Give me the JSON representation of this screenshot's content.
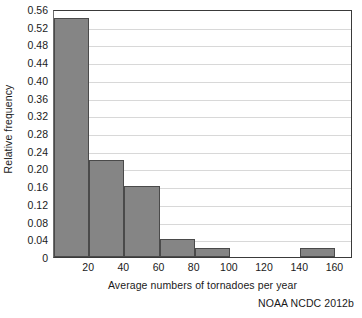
{
  "chart_data": {
    "type": "bar",
    "title": "",
    "subtitle": "",
    "xlabel": "Average numbers of tornadoes per year",
    "ylabel": "Relative frequency",
    "xlim": [
      0,
      170
    ],
    "ylim": [
      0,
      0.56
    ],
    "grid": "horizontal",
    "legend": "none",
    "xticks": [
      20,
      40,
      60,
      80,
      100,
      120,
      140,
      160
    ],
    "xtick_labels": [
      "20",
      "40",
      "60",
      "80",
      "100",
      "120",
      "140",
      "160"
    ],
    "yticks": [
      0,
      0.04,
      0.08,
      0.12,
      0.16,
      0.2,
      0.24,
      0.28,
      0.32,
      0.36,
      0.4,
      0.44,
      0.48,
      0.52,
      0.56
    ],
    "ytick_labels": [
      "0",
      "0.04",
      "0.08",
      "0.12",
      "0.16",
      "0.20",
      "0.24",
      "0.28",
      "0.32",
      "0.36",
      "0.40",
      "0.44",
      "0.48",
      "0.52",
      "0.56"
    ],
    "bin_width": 20,
    "bins": [
      {
        "label": "0-20",
        "x0": 0,
        "x1": 20,
        "value": 0.54
      },
      {
        "label": "20-40",
        "x0": 20,
        "x1": 40,
        "value": 0.22
      },
      {
        "label": "40-60",
        "x0": 40,
        "x1": 60,
        "value": 0.16
      },
      {
        "label": "60-80",
        "x0": 60,
        "x1": 80,
        "value": 0.04
      },
      {
        "label": "80-100",
        "x0": 80,
        "x1": 100,
        "value": 0.02
      },
      {
        "label": "100-120",
        "x0": 100,
        "x1": 120,
        "value": 0
      },
      {
        "label": "120-140",
        "x0": 120,
        "x1": 140,
        "value": 0
      },
      {
        "label": "140-160",
        "x0": 140,
        "x1": 160,
        "value": 0.02
      }
    ],
    "categories": [
      "0-20",
      "20-40",
      "40-60",
      "60-80",
      "80-100",
      "100-120",
      "120-140",
      "140-160"
    ],
    "values": [
      0.54,
      0.22,
      0.16,
      0.04,
      0.02,
      0,
      0,
      0.02
    ],
    "colors": {
      "bar_fill": "#858585",
      "bar_edge": "#4a4a4a",
      "gridline": "#d8d8d8",
      "axis": "#3a3a3a",
      "text": "#1a1a1a",
      "background": "#ffffff"
    }
  },
  "credit": "NOAA NCDC 2012b"
}
